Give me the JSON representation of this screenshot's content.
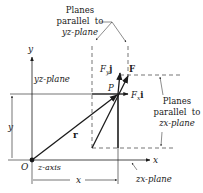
{
  "diagram": {
    "type": "vector-force-components",
    "labels": {
      "planes_yz_line1": "Planes",
      "planes_yz_line2": "parallel  to",
      "planes_yz_line3": "yz-plane",
      "y_axis": "y",
      "yz_plane": "yz-plane",
      "Fy": "F",
      "Fy_sub": "y",
      "Fy_unit": "j",
      "F": "F",
      "P": "P",
      "Fx": "F",
      "Fx_sub": "x",
      "Fx_unit": "i",
      "planes_zx_line1": "Planes",
      "planes_zx_line2": "parallel  to",
      "planes_zx_line3": "zx-plane",
      "y_dim": "y",
      "r": "r",
      "O": "O",
      "z_axis": "z-axis",
      "x_axis": "x",
      "x_dim": "x",
      "zx_plane": "zx-plane"
    },
    "colors": {
      "line": "#1a1a1a",
      "text": "#1a1a1a",
      "background": "#ffffff"
    }
  }
}
